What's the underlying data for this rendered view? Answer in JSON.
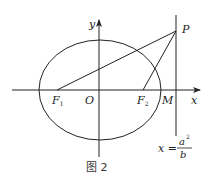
{
  "diagram": {
    "caption": "图 2",
    "axes": {
      "x_label": "x",
      "y_label": "y",
      "origin_label": "O"
    },
    "points": {
      "F1": {
        "label": "F",
        "sub": "1"
      },
      "F2": {
        "label": "F",
        "sub": "2"
      },
      "M": {
        "label": "M"
      },
      "P": {
        "label": "P"
      }
    },
    "directrix": {
      "lhs": "x =",
      "num": "a",
      "num_sup": "2",
      "den": "b"
    },
    "colors": {
      "stroke": "#222222",
      "background": "#ffffff"
    }
  }
}
